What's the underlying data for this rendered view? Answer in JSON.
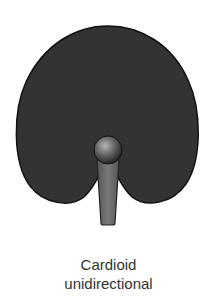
{
  "diagram": {
    "title": "Cardioid unidirectional",
    "pattern": "cardioid-polar-pattern",
    "colors": {
      "pattern_fill": "#333333",
      "pattern_outline": "#111111",
      "mic_handle": "#6e6e6e",
      "mic_head_highlight": "#9a9a9a",
      "mic_head_shadow": "#1a1a1a",
      "background": "#ffffff"
    }
  },
  "caption": {
    "line1": "Cardioid",
    "line2": "unidirectional"
  }
}
